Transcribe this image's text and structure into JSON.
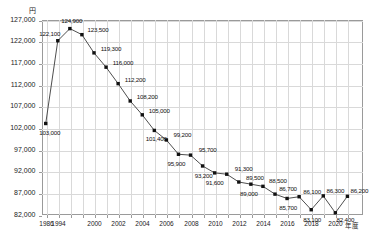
{
  "axis": {
    "y_unit_label": "円",
    "x_title": "年度",
    "y_ticks": [
      "82,000",
      "87,000",
      "92,000",
      "97,000",
      "102,000",
      "107,000",
      "112,000",
      "117,000",
      "122,000",
      "127,000"
    ],
    "x_ticks": [
      "1986",
      "1994",
      "2000",
      "2002",
      "2004",
      "2006",
      "2008",
      "2010",
      "2012",
      "2014",
      "2016",
      "2018",
      "2020"
    ]
  },
  "style": {
    "line_color": "#3a3a3a",
    "marker_color": "#111111",
    "grid_color": "#d9d9d9",
    "frame_color": "#9a9a9a"
  },
  "chart_data": {
    "type": "line",
    "title": "",
    "xlabel": "年度",
    "ylabel": "円",
    "ylim": [
      82000,
      127000
    ],
    "grid": true,
    "legend": "none",
    "x": [
      "1986",
      "1994",
      "1996",
      "1998",
      "2000",
      "2001",
      "2002",
      "2003",
      "2004",
      "2005",
      "2006",
      "2007",
      "2008",
      "2009",
      "2010",
      "2011",
      "2012",
      "2013",
      "2014",
      "2015",
      "2016",
      "2017",
      "2018",
      "2019",
      "2020",
      "2021"
    ],
    "categories": [
      "1986",
      "1994",
      "1996",
      "1998",
      "2000",
      "2001",
      "2002",
      "2003",
      "2004",
      "2005",
      "2006",
      "2007",
      "2008",
      "2009",
      "2010",
      "2011",
      "2012",
      "2013",
      "2014",
      "2015",
      "2016",
      "2017",
      "2018",
      "2019",
      "2020",
      "2021"
    ],
    "values": [
      103000,
      122100,
      124900,
      123500,
      119300,
      116000,
      112200,
      108200,
      105000,
      101400,
      99200,
      95900,
      95700,
      93200,
      91600,
      91300,
      89500,
      89000,
      88500,
      86700,
      85700,
      86100,
      83100,
      86300,
      82400,
      86200
    ],
    "data_labels": [
      "103,000",
      "122,100",
      "124,900",
      "123,500",
      "119,300",
      "116,000",
      "112,200",
      "108,200",
      "105,000",
      "101,400",
      "99,200",
      "95,900",
      "95,700",
      "93,200",
      "91,600",
      "91,300",
      "89,500",
      "89,000",
      "88,500",
      "86,700",
      "85,700",
      "86,100",
      "83,100",
      "86,300",
      "82,400",
      "86,200"
    ]
  }
}
